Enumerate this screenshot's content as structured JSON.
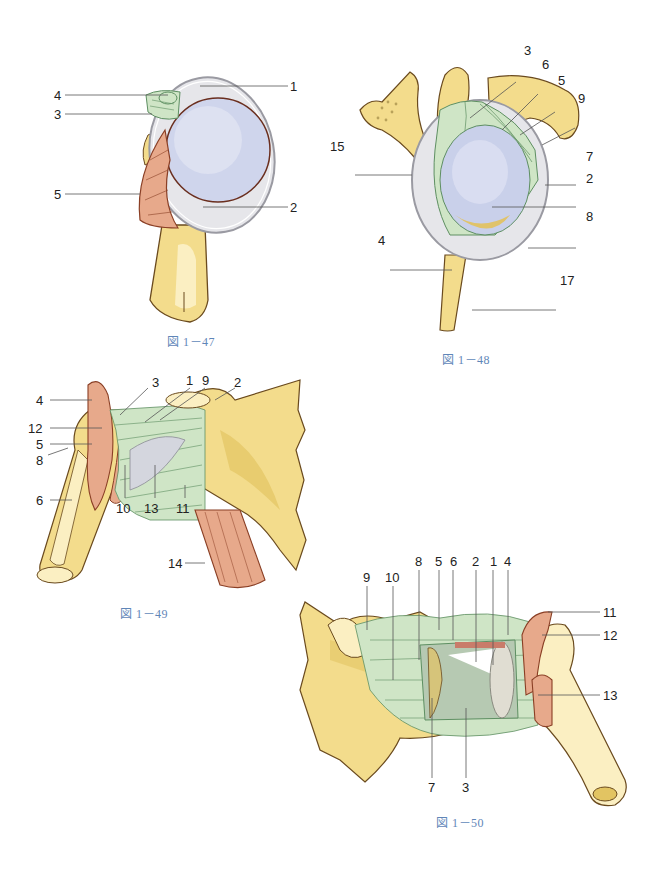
{
  "colors": {
    "bone": "#f3dc8c",
    "bone_light": "#fbefc2",
    "bone_shadow": "#d9bb55",
    "outline": "#6a4a1e",
    "ligament": "#cfe5c6",
    "ligament_line": "#5e8f62",
    "cartilage": "#e6e6ea",
    "cartilage_edge": "#9a9aa2",
    "articular": "#c9d0ea",
    "muscle": "#e7a98b",
    "muscle_line": "#8a3f25",
    "caption": "#5f86b8",
    "leader": "#555555"
  },
  "figures": [
    {
      "id": "fig-1-47",
      "caption": "図 1－47",
      "labels": [
        "1",
        "2",
        "3",
        "4",
        "5"
      ]
    },
    {
      "id": "fig-1-48",
      "caption": "図 1－48",
      "labels": [
        "3",
        "6",
        "5",
        "9",
        "15",
        "7",
        "2",
        "8",
        "4",
        "17"
      ]
    },
    {
      "id": "fig-1-49",
      "caption": "図 1－49",
      "labels": [
        "4",
        "3",
        "1",
        "9",
        "2",
        "12",
        "5",
        "8",
        "6",
        "10",
        "13",
        "11",
        "14"
      ]
    },
    {
      "id": "fig-1-50",
      "caption": "図 1－50",
      "labels": [
        "8",
        "5",
        "6",
        "2",
        "1",
        "4",
        "9",
        "10",
        "11",
        "12",
        "13",
        "7",
        "3"
      ]
    }
  ]
}
